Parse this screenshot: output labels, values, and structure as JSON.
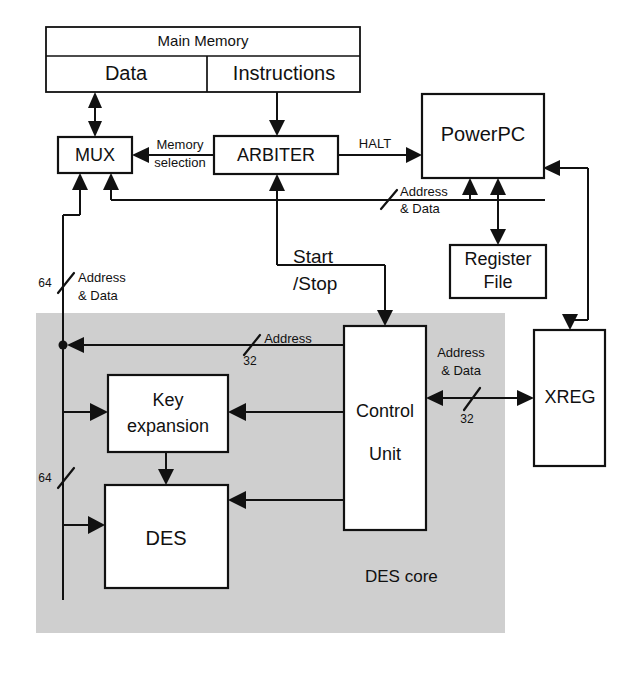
{
  "diagram": {
    "core_region_label": "DES core",
    "colors": {
      "core_fill": "#cfcfcf",
      "line": "#111111",
      "block_fill": "#ffffff",
      "background": "#ffffff"
    },
    "blocks": [
      {
        "id": "main_memory",
        "label": "Main Memory"
      },
      {
        "id": "data",
        "label": "Data"
      },
      {
        "id": "instructions",
        "label": "Instructions"
      },
      {
        "id": "mux",
        "label": "MUX"
      },
      {
        "id": "arbiter",
        "label": "ARBITER"
      },
      {
        "id": "powerpc",
        "label": "PowerPC"
      },
      {
        "id": "register_file",
        "label_line1": "Register",
        "label_line2": "File"
      },
      {
        "id": "xreg",
        "label": "XREG"
      },
      {
        "id": "key_expansion",
        "label_line1": "Key",
        "label_line2": "expansion"
      },
      {
        "id": "des",
        "label": "DES"
      },
      {
        "id": "control_unit",
        "label_line1": "Control",
        "label_line2": "Unit"
      }
    ],
    "signals": {
      "memory_selection_line1": "Memory",
      "memory_selection_line2": "selection",
      "halt": "HALT",
      "start_stop_line1": "Start",
      "start_stop_line2": "/Stop",
      "addr_data_bus_line1": "Address",
      "addr_data_bus_line2": "& Data",
      "left_bus_line1": "Address",
      "left_bus_line2": "& Data",
      "core_address": "Address",
      "xreg_addr_data_line1": "Address",
      "xreg_addr_data_line2": "& Data"
    },
    "bus_widths": {
      "left_bus_upper": "64",
      "left_bus_lower": "64",
      "control_address": "32",
      "xreg_bus": "32"
    }
  }
}
